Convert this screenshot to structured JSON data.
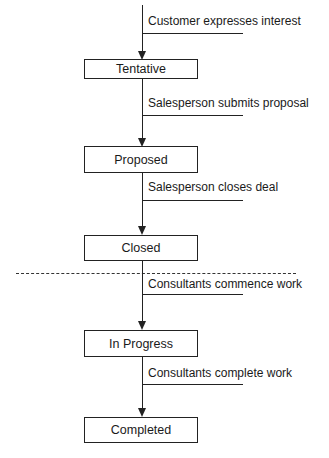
{
  "states": [
    {
      "label": "Tentative"
    },
    {
      "label": "Proposed"
    },
    {
      "label": "Closed"
    },
    {
      "label": "In Progress"
    },
    {
      "label": "Completed"
    }
  ],
  "transitions": [
    {
      "label": "Customer expresses interest",
      "to": "Tentative"
    },
    {
      "label": "Salesperson submits proposal",
      "from": "Tentative",
      "to": "Proposed"
    },
    {
      "label": "Salesperson closes deal",
      "from": "Proposed",
      "to": "Closed"
    },
    {
      "label": "Consultants commence work",
      "from": "Closed",
      "to": "In Progress"
    },
    {
      "label": "Consultants complete work",
      "from": "In Progress",
      "to": "Completed"
    }
  ],
  "divider": {
    "style": "dashed",
    "between": [
      "Closed",
      "In Progress"
    ]
  }
}
